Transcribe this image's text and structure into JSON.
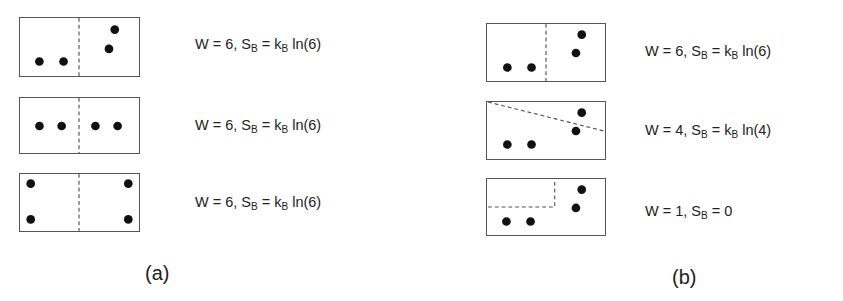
{
  "panels": [
    {
      "id": "a",
      "caption": "(a)",
      "rows": [
        {
          "box": {
            "x": 19,
            "y": 17,
            "w": 121,
            "h": 60
          },
          "divider": {
            "type": "vertical",
            "points": [
              [
                60,
                0
              ],
              [
                60,
                60
              ]
            ]
          },
          "particles": [
            [
              19,
              45
            ],
            [
              44,
              45
            ],
            [
              91,
              32
            ],
            [
              97,
              12
            ]
          ],
          "equation": {
            "W_prefix": "W = ",
            "W": "6",
            "S_sym": ", S",
            "S_sub": "B",
            "eq": " = k",
            "k_sub": "B",
            "rhs": " ln(6)"
          }
        },
        {
          "box": {
            "x": 19,
            "y": 97,
            "w": 121,
            "h": 57
          },
          "divider": {
            "type": "vertical",
            "points": [
              [
                60,
                0
              ],
              [
                60,
                57
              ]
            ]
          },
          "particles": [
            [
              19,
              29
            ],
            [
              42,
              29
            ],
            [
              77,
              29
            ],
            [
              100,
              29
            ]
          ],
          "equation": {
            "W_prefix": "W = ",
            "W": "6",
            "S_sym": ", S",
            "S_sub": "B",
            "eq": " = k",
            "k_sub": "B",
            "rhs": " ln(6)"
          }
        },
        {
          "box": {
            "x": 19,
            "y": 173,
            "w": 121,
            "h": 59
          },
          "divider": {
            "type": "vertical",
            "points": [
              [
                60,
                0
              ],
              [
                60,
                59
              ]
            ]
          },
          "particles": [
            [
              10,
              10
            ],
            [
              10,
              47
            ],
            [
              111,
              10
            ],
            [
              111,
              47
            ]
          ],
          "equation": {
            "W_prefix": "W = ",
            "W": "6",
            "S_sym": ", S",
            "S_sub": "B",
            "eq": " = k",
            "k_sub": "B",
            "rhs": " ln(6)"
          }
        }
      ]
    },
    {
      "id": "b",
      "caption": "(b)",
      "rows": [
        {
          "box": {
            "x": 486,
            "y": 23,
            "w": 120,
            "h": 59
          },
          "divider": {
            "type": "vertical",
            "points": [
              [
                60,
                0
              ],
              [
                60,
                59
              ]
            ]
          },
          "particles": [
            [
              20,
              45
            ],
            [
              45,
              45
            ],
            [
              91,
              30
            ],
            [
              97,
              11
            ]
          ],
          "equation": {
            "W_prefix": "W = ",
            "W": "6",
            "S_sym": ", S",
            "S_sub": "B",
            "eq": " = k",
            "k_sub": "B",
            "rhs": " ln(6)"
          }
        },
        {
          "box": {
            "x": 486,
            "y": 101,
            "w": 120,
            "h": 59
          },
          "divider": {
            "type": "diagonal",
            "points": [
              [
                0,
                0
              ],
              [
                120,
                30
              ]
            ]
          },
          "particles": [
            [
              20,
              44
            ],
            [
              45,
              44
            ],
            [
              91,
              30
            ],
            [
              97,
              11
            ]
          ],
          "equation": {
            "W_prefix": "W = ",
            "W": "4",
            "S_sym": ", S",
            "S_sub": "B",
            "eq": " = k",
            "k_sub": "B",
            "rhs": " ln(4)"
          }
        },
        {
          "box": {
            "x": 486,
            "y": 178,
            "w": 120,
            "h": 58
          },
          "divider": {
            "type": "corner",
            "points": [
              [
                0,
                29
              ],
              [
                69,
                29
              ],
              [
                69,
                0
              ]
            ]
          },
          "particles": [
            [
              19,
              44
            ],
            [
              44,
              44
            ],
            [
              91,
              30
            ],
            [
              97,
              11
            ]
          ],
          "equation": {
            "W_prefix": "W = ",
            "W": "1",
            "S_sym": ", S",
            "S_sub": "B",
            "eq": " = 0",
            "k_sub": "",
            "rhs": ""
          }
        }
      ]
    }
  ],
  "layout": {
    "equation_positions": {
      "a": [
        [
          195,
          36
        ],
        [
          195,
          117
        ],
        [
          195,
          194
        ]
      ],
      "b": [
        [
          645,
          43
        ],
        [
          645,
          122
        ],
        [
          645,
          203
        ]
      ]
    },
    "caption_positions": {
      "a": [
        145,
        262
      ],
      "b": [
        672,
        266
      ]
    }
  },
  "colors": {
    "line": "#555555",
    "particle": "#111111",
    "text": "#222222",
    "divider": "#555555"
  }
}
